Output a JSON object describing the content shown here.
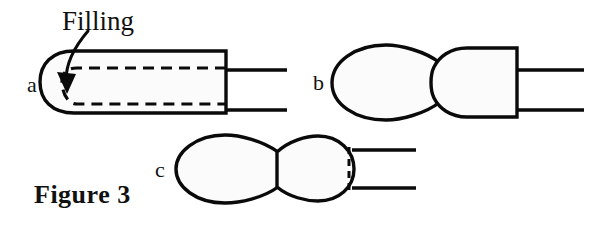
{
  "figure": {
    "caption": "Figure 3",
    "background_color": "#ffffff",
    "ink_color": "#0a0a0a",
    "fill_color": "#fbfbfb",
    "annotation": {
      "label": "Filling",
      "pointer": "arrow"
    },
    "panels": [
      {
        "letter": "a",
        "description": "capsule body with rounded left cap, flat right end, dashed inner filling outline, two parallel lines extending right",
        "has_dashed_filling_outline": true,
        "has_dashed_seam": false,
        "lead_lines": 2
      },
      {
        "letter": "b",
        "description": "ellipse joined to rounded-left rectangle with flat right end, two parallel lines extending right",
        "has_dashed_filling_outline": false,
        "has_dashed_seam": false,
        "lead_lines": 2
      },
      {
        "letter": "c",
        "description": "two joined ellipses with dashed vertical seam at right, two parallel lines extending right",
        "has_dashed_filling_outline": false,
        "has_dashed_seam": true,
        "lead_lines": 2
      }
    ]
  }
}
